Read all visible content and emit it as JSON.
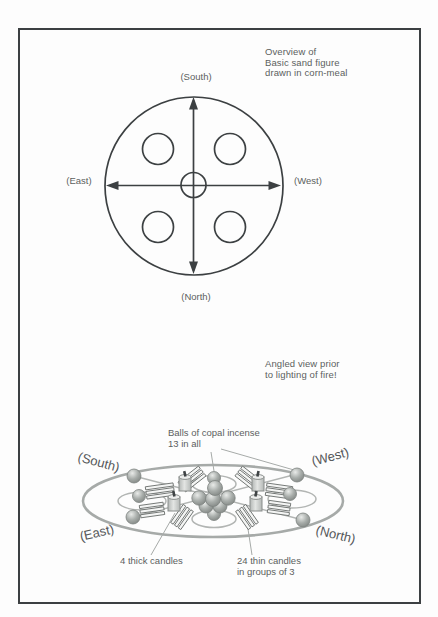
{
  "figure": {
    "overview": {
      "caption": "Overview of\nBasic sand figure\ndrawn in corn-meal",
      "direction_labels": {
        "south": "(South)",
        "east": "(East)",
        "west": "(West)",
        "north": "(North)"
      }
    },
    "angled": {
      "caption": "Angled view prior\nto lighting of fire!",
      "direction_labels": {
        "south": "(South)",
        "west": "(West)",
        "east": "(East)",
        "north": "(North)"
      },
      "annotations": {
        "incense_balls": "Balls of copal incense\n13 in all",
        "thick_candles": "4 thick candles",
        "thin_candles": "24 thin candles\nin groups of 3"
      }
    },
    "colors": {
      "ink_dark": "#3c4042",
      "ink_light": "#a6aaa8",
      "text_gray": "#5c5f5e",
      "ball_fill": "#a0a5a2",
      "background": "#fdfdfd"
    }
  }
}
